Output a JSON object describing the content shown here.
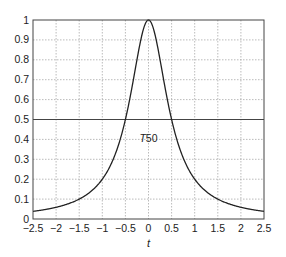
{
  "chart_data": {
    "type": "line",
    "title": "",
    "xlabel": "t",
    "ylabel": "",
    "xlim": [
      -2.5,
      2.5
    ],
    "ylim": [
      0,
      1
    ],
    "xticks": [
      -2.5,
      -2,
      -1.5,
      -1,
      -0.5,
      0,
      0.5,
      1,
      1.5,
      2,
      2.5
    ],
    "xtick_labels": [
      "−2.5",
      "−2",
      "−1.5",
      "−1",
      "−0.5",
      "0",
      "0.5",
      "1",
      "1.5",
      "2",
      "2.5"
    ],
    "yticks": [
      0,
      0.1,
      0.2,
      0.3,
      0.4,
      0.5,
      0.6,
      0.7,
      0.8,
      0.9,
      1
    ],
    "ytick_labels": [
      "0",
      "0.1",
      "0.2",
      "0.3",
      "0.4",
      "0.5",
      "0.6",
      "0.7",
      "0.8",
      "0.9",
      "1"
    ],
    "grid": true,
    "legend": null,
    "series": [
      {
        "name": "pulse",
        "x": [
          -2.5,
          -2.25,
          -2,
          -1.75,
          -1.5,
          -1.25,
          -1,
          -0.875,
          -0.75,
          -0.625,
          -0.5,
          -0.4,
          -0.3,
          -0.2,
          -0.1,
          0,
          0.1,
          0.2,
          0.3,
          0.4,
          0.5,
          0.625,
          0.75,
          0.875,
          1,
          1.25,
          1.5,
          1.75,
          2,
          2.25,
          2.5
        ],
        "y": [
          0.038,
          0.047,
          0.059,
          0.075,
          0.1,
          0.138,
          0.2,
          0.246,
          0.308,
          0.39,
          0.5,
          0.61,
          0.735,
          0.862,
          0.962,
          1.0,
          0.962,
          0.862,
          0.735,
          0.61,
          0.5,
          0.39,
          0.308,
          0.246,
          0.2,
          0.138,
          0.1,
          0.075,
          0.059,
          0.047,
          0.038
        ]
      },
      {
        "name": "half-level",
        "x": [
          -2.5,
          2.5
        ],
        "y": [
          0.5,
          0.5
        ]
      }
    ],
    "annotations": [
      {
        "text": "T50",
        "x": 0,
        "y": 0.4
      }
    ]
  },
  "colors": {
    "curve": "#222222",
    "axis": "#444444",
    "grid": "#aaaaaa",
    "background": "#ffffff"
  }
}
